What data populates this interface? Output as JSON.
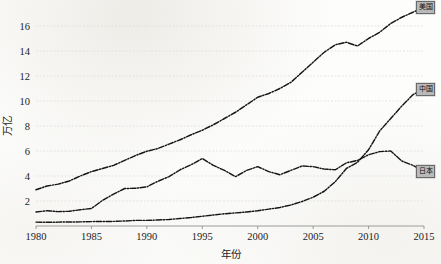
{
  "chart_data": {
    "type": "line",
    "title": "",
    "xlabel": "年份",
    "ylabel": "万亿",
    "xlim": [
      1980,
      2015
    ],
    "ylim": [
      0,
      17.6
    ],
    "yticks": [
      2,
      4,
      6,
      8,
      10,
      12,
      14,
      16
    ],
    "xticks": [
      1980,
      1985,
      1990,
      1995,
      2000,
      2005,
      2010,
      2015
    ],
    "grid": "horizontal-dotted",
    "legend_position": "line-end-labels",
    "line_style": "dash-dot",
    "line_color": "#151515",
    "x": [
      1980,
      1981,
      1982,
      1983,
      1984,
      1985,
      1986,
      1987,
      1988,
      1989,
      1990,
      1991,
      1992,
      1993,
      1994,
      1995,
      1996,
      1997,
      1998,
      1999,
      2000,
      2001,
      2002,
      2003,
      2004,
      2005,
      2006,
      2007,
      2008,
      2009,
      2010,
      2011,
      2012,
      2013,
      2014,
      2015
    ],
    "series": [
      {
        "name": "美国",
        "values": [
          2.9,
          3.2,
          3.35,
          3.6,
          4.0,
          4.35,
          4.6,
          4.85,
          5.25,
          5.65,
          5.98,
          6.2,
          6.55,
          6.9,
          7.3,
          7.66,
          8.1,
          8.6,
          9.1,
          9.7,
          10.3,
          10.6,
          11.0,
          11.5,
          12.3,
          13.1,
          13.9,
          14.5,
          14.7,
          14.4,
          15.0,
          15.5,
          16.2,
          16.7,
          17.1,
          17.5
        ]
      },
      {
        "name": "中国",
        "values": [
          0.31,
          0.3,
          0.31,
          0.32,
          0.33,
          0.35,
          0.36,
          0.37,
          0.4,
          0.45,
          0.45,
          0.48,
          0.52,
          0.6,
          0.68,
          0.78,
          0.88,
          0.98,
          1.05,
          1.12,
          1.22,
          1.35,
          1.48,
          1.68,
          1.96,
          2.3,
          2.78,
          3.55,
          4.6,
          5.1,
          6.1,
          7.6,
          8.6,
          9.6,
          10.5,
          11.0
        ]
      },
      {
        "name": "日本",
        "values": [
          1.12,
          1.22,
          1.15,
          1.18,
          1.3,
          1.4,
          2.05,
          2.55,
          3.0,
          3.02,
          3.13,
          3.58,
          3.95,
          4.5,
          4.9,
          5.4,
          4.85,
          4.45,
          3.95,
          4.45,
          4.75,
          4.35,
          4.1,
          4.45,
          4.8,
          4.75,
          4.55,
          4.5,
          5.05,
          5.25,
          5.7,
          5.95,
          6.0,
          5.2,
          4.85,
          4.4
        ]
      }
    ],
    "end_labels": [
      {
        "name": "美国",
        "year": 2015,
        "value": 17.5
      },
      {
        "name": "中国",
        "year": 2015,
        "value": 11.0
      },
      {
        "name": "日本",
        "year": 2015,
        "value": 4.4
      }
    ]
  }
}
